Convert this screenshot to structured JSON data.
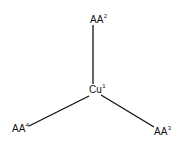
{
  "diagram": {
    "center": {
      "base": "Cu",
      "sup": "1"
    },
    "top": {
      "base": "AA",
      "sup": "2"
    },
    "bottom_right": {
      "base": "AA",
      "sup": "3"
    },
    "bottom_left": {
      "base": "AA",
      "sup": "4"
    },
    "line_color": "#111111"
  }
}
